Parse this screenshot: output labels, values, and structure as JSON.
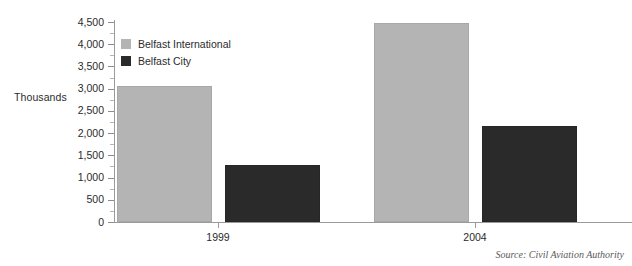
{
  "chart_data": {
    "type": "bar",
    "title": "",
    "xlabel": "",
    "ylabel": "Thousands",
    "categories": [
      "1999",
      "2004"
    ],
    "series": [
      {
        "name": "Belfast International",
        "color": "#b4b4b4",
        "values": [
          3050,
          4480
        ]
      },
      {
        "name": "Belfast City",
        "color": "#2a2a2a",
        "values": [
          1280,
          2150
        ]
      }
    ],
    "ylim": [
      0,
      4500
    ],
    "y_major_ticks": [
      0,
      500,
      1000,
      1500,
      2000,
      2500,
      3000,
      3500,
      4000,
      4500
    ],
    "y_tick_labels": [
      "0",
      "500",
      "1,000",
      "1,500",
      "2,000",
      "2,500",
      "3,000",
      "3,500",
      "4,000",
      "4,500"
    ],
    "y_minor_tick_step": 250,
    "grid": false,
    "legend_position": "top-left",
    "annotations": [
      "Source: Civil Aviation Authority"
    ]
  },
  "axis": {
    "y_title": "Thousands"
  },
  "legend": {
    "items": [
      {
        "label": "Belfast International"
      },
      {
        "label": "Belfast City"
      }
    ]
  },
  "footer": {
    "source": "Source: Civil Aviation Authority"
  }
}
